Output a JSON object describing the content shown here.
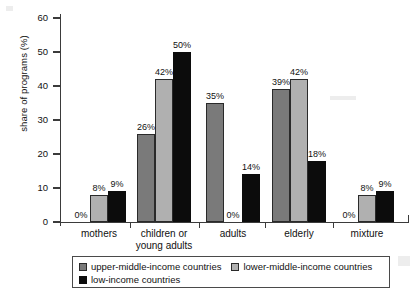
{
  "chart_data": {
    "type": "bar",
    "title": "",
    "xlabel": "",
    "ylabel": "share of programs (%)",
    "ylim": [
      0,
      60
    ],
    "yticks": [
      0,
      10,
      20,
      30,
      40,
      50,
      60
    ],
    "grid": false,
    "legend_position": "bottom",
    "categories": [
      "mothers",
      "children or young adults",
      "adults",
      "elderly",
      "mixture"
    ],
    "category_lines": [
      [
        "mothers"
      ],
      [
        "children or",
        "young adults"
      ],
      [
        "adults"
      ],
      [
        "elderly"
      ],
      [
        "mixture"
      ]
    ],
    "series": [
      {
        "name": "upper-middle-income countries",
        "color": "#7a7a7a",
        "values": [
          0,
          26,
          35,
          39,
          0
        ],
        "labels": [
          "0%",
          "26%",
          "35%",
          "39%",
          "0%"
        ]
      },
      {
        "name": "lower-middle-income countries",
        "color": "#b0b0b0",
        "values": [
          8,
          42,
          0,
          42,
          8
        ],
        "labels": [
          "8%",
          "42%",
          "0%",
          "42%",
          "8%"
        ]
      },
      {
        "name": "low-income countries",
        "color": "#0c0c0c",
        "values": [
          9,
          50,
          14,
          18,
          9
        ],
        "labels": [
          "9%",
          "50%",
          "14%",
          "18%",
          "9%"
        ]
      }
    ]
  },
  "axis": {
    "y_label": "share of programs (%)",
    "y_tick_labels": [
      "0",
      "10",
      "20",
      "30",
      "40",
      "50",
      "60"
    ]
  },
  "legend": {
    "items": [
      {
        "label": "upper-middle-income countries",
        "swatch": "dark-gray-swatch"
      },
      {
        "label": "lower-middle-income countries",
        "swatch": "light-gray-swatch"
      },
      {
        "label": "low-income countries",
        "swatch": "black-swatch"
      }
    ]
  },
  "value_labels": {
    "mothers": {
      "s0": "0%",
      "s1": "8%",
      "s2": "9%"
    },
    "children": {
      "s0": "26%",
      "s1": "42%",
      "s2": "50%"
    },
    "adults": {
      "s0": "35%",
      "s1": "0%",
      "s2": "14%"
    },
    "elderly": {
      "s0": "39%",
      "s1": "42%",
      "s2": "18%"
    },
    "mixture": {
      "s0": "0%",
      "s1": "8%",
      "s2": "9%"
    }
  },
  "colors": {
    "series_upper_middle": "#7a7a7a",
    "series_lower_middle": "#b0b0b0",
    "series_low": "#0c0c0c",
    "axis": "#3b3b3b",
    "background": "#ffffff"
  }
}
